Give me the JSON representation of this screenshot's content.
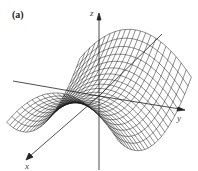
{
  "figure": {
    "panel_label": "(a)",
    "surface": "saddle (hyperbolic paraboloid) wireframe",
    "axes": {
      "x_label": "x",
      "y_label": "y",
      "z_label": "z"
    },
    "colors": {
      "background": "#ffffff",
      "mesh": "#1a1a1a",
      "axis": "#222222"
    }
  }
}
